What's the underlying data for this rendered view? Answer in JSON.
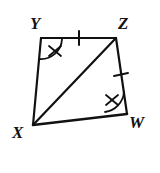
{
  "figure": {
    "background_color": "#ffffff",
    "stroke_color": "#111111",
    "stroke_width": 2.2,
    "width": 160,
    "height": 173
  },
  "vertices": [
    {
      "name": "Y",
      "label": "Y",
      "x": 41,
      "y": 38,
      "label_x": 30,
      "label_y": 15
    },
    {
      "name": "Z",
      "label": "Z",
      "x": 116,
      "y": 38,
      "label_x": 118,
      "label_y": 15
    },
    {
      "name": "W",
      "label": "W",
      "x": 127,
      "y": 114,
      "label_x": 129,
      "label_y": 114
    },
    {
      "name": "X",
      "label": "X",
      "x": 33,
      "y": 125,
      "label_x": 12,
      "label_y": 124
    }
  ],
  "edges": [
    {
      "name": "YZ",
      "from": "Y",
      "to": "Z",
      "tick_marks": 1
    },
    {
      "name": "ZW",
      "from": "Z",
      "to": "W",
      "tick_marks": 1
    },
    {
      "name": "WX",
      "from": "W",
      "to": "X",
      "tick_marks": 0
    },
    {
      "name": "XY",
      "from": "X",
      "to": "Y",
      "tick_marks": 0
    },
    {
      "name": "XZ",
      "from": "X",
      "to": "Z",
      "tick_marks": 0,
      "is_diagonal": true
    }
  ],
  "angle_marks": [
    {
      "name": "angle-Y",
      "vertex": "Y",
      "arc_slashes": 1
    },
    {
      "name": "angle-W",
      "vertex": "W",
      "arc_slashes": 1
    }
  ]
}
